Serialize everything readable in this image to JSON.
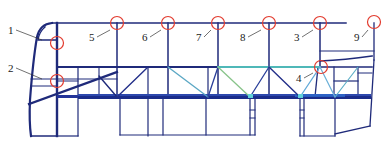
{
  "diagram": {
    "type": "bus body frame structure",
    "colors": {
      "frame": "#1f2a7a",
      "frame_dark": "#14206a",
      "member_light": "#3a8fd6",
      "member_teal": "#4fb8b8",
      "member_green": "#7fc9a0",
      "marker": "#e23b2e",
      "leader": "#333333"
    },
    "markers": [
      {
        "id": "1",
        "label": "1",
        "cx": 57,
        "cy": 43,
        "lx": 12,
        "ly": 34,
        "tx": 42,
        "ty": 40
      },
      {
        "id": "2",
        "label": "2",
        "cx": 57,
        "cy": 81,
        "lx": 12,
        "ly": 72,
        "tx": 42,
        "ty": 79
      },
      {
        "id": "5",
        "label": "5",
        "cx": 117,
        "cy": 23,
        "lx": 93,
        "ly": 41,
        "tx": 110,
        "ty": 30
      },
      {
        "id": "6",
        "label": "6",
        "cx": 168,
        "cy": 23,
        "lx": 146,
        "ly": 41,
        "tx": 161,
        "ty": 30
      },
      {
        "id": "7",
        "label": "7",
        "cx": 218,
        "cy": 23,
        "lx": 200,
        "ly": 41,
        "tx": 211,
        "ty": 30
      },
      {
        "id": "8",
        "label": "8",
        "cx": 269,
        "cy": 23,
        "lx": 244,
        "ly": 41,
        "tx": 261,
        "ty": 30
      },
      {
        "id": "3",
        "label": "3",
        "cx": 320,
        "cy": 23,
        "lx": 298,
        "ly": 41,
        "tx": 313,
        "ty": 30
      },
      {
        "id": "9",
        "label": "9",
        "cx": 374,
        "cy": 22,
        "lx": 358,
        "ly": 41,
        "tx": 368,
        "ty": 30
      },
      {
        "id": "4",
        "label": "4",
        "cx": 321,
        "cy": 67,
        "lx": 300,
        "ly": 82,
        "tx": 313,
        "ty": 73
      }
    ]
  }
}
